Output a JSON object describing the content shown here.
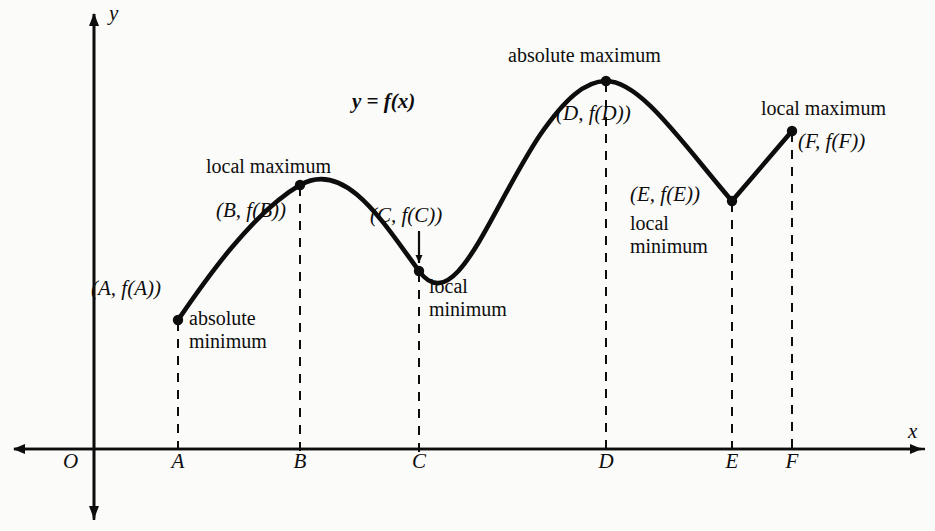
{
  "figure": {
    "background_color": "#fbfbf9",
    "ink_color": "#0d0d0d"
  },
  "axes": {
    "x_axis_label": "x",
    "y_axis_label": "y",
    "origin_label": "O",
    "x_axis_y_px": 449,
    "y_axis_x_px": 94,
    "tick_labels": [
      "A",
      "B",
      "C",
      "D",
      "E",
      "F"
    ]
  },
  "function_label": "y = f(x)",
  "annotations": {
    "point_A": {
      "coord_label": "(A, f(A))",
      "caption_line1": "absolute",
      "caption_line2": "minimum"
    },
    "point_B": {
      "coord_label": "(B, f(B))",
      "caption": "local maximum"
    },
    "point_C": {
      "coord_label": "(C, f(C))",
      "caption_line1": "local",
      "caption_line2": "minimum"
    },
    "point_D": {
      "coord_label": "(D, f(D))",
      "caption": "absolute maximum"
    },
    "point_E": {
      "coord_label": "(E, f(E))",
      "caption_line1": "local",
      "caption_line2": "minimum"
    },
    "point_F": {
      "coord_label": "(F, f(F))",
      "caption": "local maximum"
    }
  },
  "chart_data": {
    "type": "line",
    "title": "",
    "xlabel": "x",
    "ylabel": "y",
    "grid": false,
    "legend": null,
    "xlim": [
      0,
      935
    ],
    "ylim": [
      0,
      531
    ],
    "note": "Pixel coordinates measured from the screenshot; y grows downward in pixel space, the x-axis baseline is y=449.",
    "labeled_points": [
      {
        "name": "A",
        "x_px": 178,
        "y_px": 320,
        "tick": "A",
        "kind": "absolute minimum",
        "coord_label": "(A, f(A))"
      },
      {
        "name": "B",
        "x_px": 300,
        "y_px": 185,
        "tick": "B",
        "kind": "local maximum",
        "coord_label": "(B, f(B))"
      },
      {
        "name": "C",
        "x_px": 419,
        "y_px": 271,
        "tick": "C",
        "kind": "local minimum",
        "coord_label": "(C, f(C))"
      },
      {
        "name": "D",
        "x_px": 606,
        "y_px": 81,
        "tick": "D",
        "kind": "absolute maximum",
        "coord_label": "(D, f(D))"
      },
      {
        "name": "E",
        "x_px": 732,
        "y_px": 201,
        "tick": "E",
        "kind": "local minimum",
        "coord_label": "(E, f(E))"
      },
      {
        "name": "F",
        "x_px": 792,
        "y_px": 131,
        "tick": "F",
        "kind": "local maximum",
        "coord_label": "(F, f(F))"
      }
    ],
    "curve_path": "M 178 320 C 200 288 250 214 300 185 C 345 159 383 222 419 271 C 455 320 490 210 540 135 C 565 99 585 81 606 81 C 640 81 680 140 732 201 L 792 131",
    "dashed_drop_lines": [
      {
        "tick": "A",
        "x_px": 178,
        "from_y_px": 320,
        "to_y_px": 449
      },
      {
        "tick": "B",
        "x_px": 300,
        "from_y_px": 185,
        "to_y_px": 449
      },
      {
        "tick": "C",
        "x_px": 419,
        "from_y_px": 271,
        "to_y_px": 449
      },
      {
        "tick": "D",
        "x_px": 606,
        "from_y_px": 81,
        "to_y_px": 449
      },
      {
        "tick": "E",
        "x_px": 732,
        "from_y_px": 201,
        "to_y_px": 449
      },
      {
        "tick": "F",
        "x_px": 792,
        "from_y_px": 131,
        "to_y_px": 449
      }
    ]
  }
}
